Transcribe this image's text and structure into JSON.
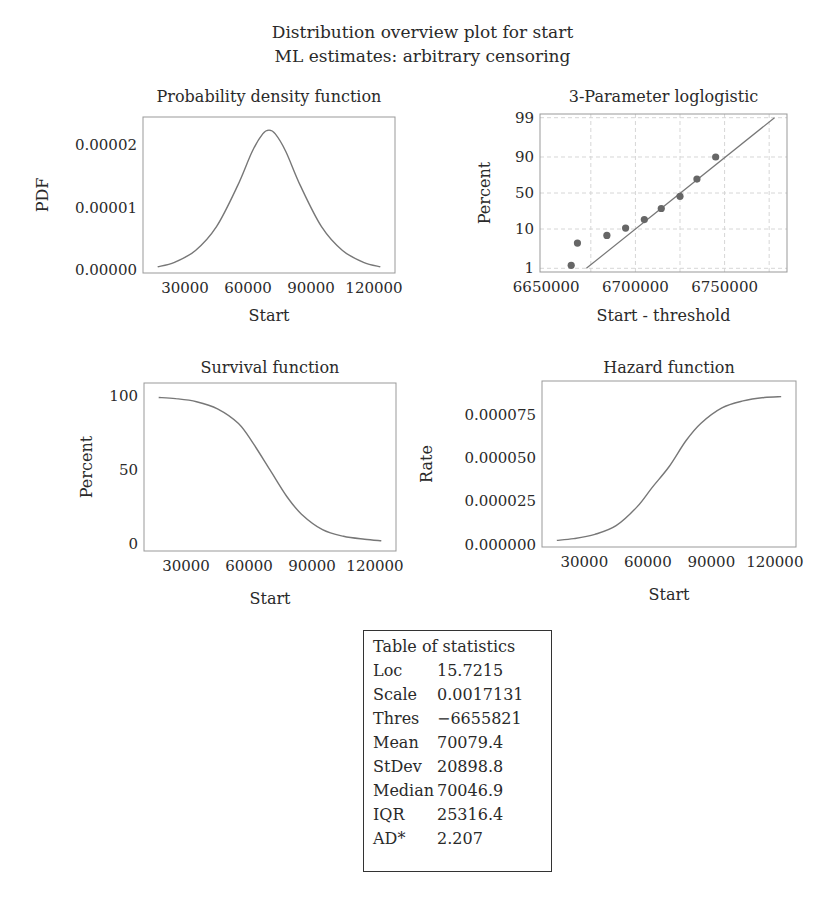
{
  "figure": {
    "title": "Distribution overview plot for start",
    "subtitle": "ML estimates: arbitrary censoring",
    "colors": {
      "curve": "#777777",
      "frame": "#999999",
      "grid": "#d6d6d6",
      "points": "#666666",
      "text": "#2a2a2a"
    }
  },
  "chart_data": [
    {
      "id": "pdf",
      "type": "line",
      "title": "Probability density function",
      "xlabel": "Start",
      "ylabel": "PDF",
      "xticks": [
        30000,
        60000,
        90000,
        120000
      ],
      "xtick_labels": [
        "30000",
        "60000",
        "90000",
        "120000"
      ],
      "yticks": [
        0,
        1e-05,
        2e-05
      ],
      "ytick_labels": [
        "0.00000",
        "0.00001",
        "0.00002"
      ],
      "xlim": [
        10000,
        130000
      ],
      "ylim": [
        -4e-07,
        2.45e-05
      ],
      "grid": false,
      "x": [
        17000,
        25000,
        35000,
        45000,
        55000,
        62000,
        67000,
        70000,
        73000,
        78000,
        85000,
        95000,
        105000,
        115000,
        123000
      ],
      "y": [
        6e-07,
        1.3e-06,
        3.2e-06,
        7e-06,
        1.35e-05,
        1.9e-05,
        2.18e-05,
        2.24e-05,
        2.18e-05,
        1.9e-05,
        1.35e-05,
        7e-06,
        3.2e-06,
        1.3e-06,
        6e-07
      ]
    },
    {
      "id": "probability-plot",
      "type": "scatter",
      "title": "3-Parameter loglogistic",
      "xlabel": "Start - threshold",
      "ylabel": "Percent",
      "xticks": [
        6650000,
        6700000,
        6750000
      ],
      "xtick_labels": [
        "6650000",
        "6700000",
        "6750000"
      ],
      "yticks": [
        1,
        10,
        50,
        90,
        99
      ],
      "ytick_labels": [
        "1",
        "10",
        "50",
        "90",
        "99"
      ],
      "xlim": [
        6646500,
        6785000
      ],
      "grid": true,
      "grid_x": [
        6675000,
        6700000,
        6725000,
        6750000,
        6775000
      ],
      "points": [
        {
          "x": 6664000,
          "p": 1.2
        },
        {
          "x": 6667500,
          "p": 4.5
        },
        {
          "x": 6684000,
          "p": 7.0
        },
        {
          "x": 6694500,
          "p": 10.5
        },
        {
          "x": 6705000,
          "p": 16.5
        },
        {
          "x": 6714500,
          "p": 28.0
        },
        {
          "x": 6725000,
          "p": 45.0
        },
        {
          "x": 6734500,
          "p": 70.0
        },
        {
          "x": 6745000,
          "p": 90.0
        }
      ],
      "fit_line": [
        {
          "x": 6672500,
          "p": 1.0
        },
        {
          "x": 6778000,
          "p": 99.0
        }
      ]
    },
    {
      "id": "survival",
      "type": "line",
      "title": "Survival function",
      "xlabel": "Start",
      "ylabel": "Percent",
      "xticks": [
        30000,
        60000,
        90000,
        120000
      ],
      "xtick_labels": [
        "30000",
        "60000",
        "90000",
        "120000"
      ],
      "yticks": [
        0,
        50,
        100
      ],
      "ytick_labels": [
        "0",
        "50",
        "100"
      ],
      "xlim": [
        10000,
        130000
      ],
      "ylim": [
        -5,
        109
      ],
      "grid": false,
      "x": [
        17000,
        25000,
        35000,
        45000,
        55000,
        62000,
        70000,
        78000,
        85000,
        95000,
        105000,
        115000,
        123000
      ],
      "y": [
        99.2,
        98.4,
        96.3,
        91.5,
        81.5,
        68.0,
        50.0,
        32.0,
        20.0,
        9.5,
        5.0,
        3.0,
        2.0
      ]
    },
    {
      "id": "hazard",
      "type": "line",
      "title": "Hazard function",
      "xlabel": "Start",
      "ylabel": "Rate",
      "xticks": [
        30000,
        60000,
        90000,
        120000
      ],
      "xtick_labels": [
        "30000",
        "60000",
        "90000",
        "120000"
      ],
      "yticks": [
        0,
        2.5e-05,
        5e-05,
        7.5e-05
      ],
      "ytick_labels": [
        "0.000000",
        "0.000025",
        "0.000050",
        "0.000075"
      ],
      "xlim": [
        10000,
        130000
      ],
      "ylim": [
        -1.3e-06,
        9.45e-05
      ],
      "grid": false,
      "x": [
        17000,
        25000,
        35000,
        45000,
        55000,
        62000,
        70000,
        78000,
        85000,
        95000,
        105000,
        115000,
        123000
      ],
      "y": [
        2.5e-06,
        3.5e-06,
        6e-06,
        1.1e-05,
        2.2e-05,
        3.3e-05,
        4.5e-05,
        6e-05,
        7e-05,
        7.9e-05,
        8.3e-05,
        8.5e-05,
        8.55e-05
      ]
    }
  ],
  "stats_table": {
    "title": "Table of statistics",
    "rows": [
      {
        "label": "Loc",
        "value": "15.7215"
      },
      {
        "label": "Scale",
        "value": "0.0017131"
      },
      {
        "label": "Thres",
        "value": "−6655821"
      },
      {
        "label": "Mean",
        "value": "70079.4"
      },
      {
        "label": "StDev",
        "value": "20898.8"
      },
      {
        "label": "Median",
        "value": "70046.9"
      },
      {
        "label": "IQR",
        "value": "25316.4"
      },
      {
        "label": "AD*",
        "value": "2.207"
      }
    ]
  }
}
